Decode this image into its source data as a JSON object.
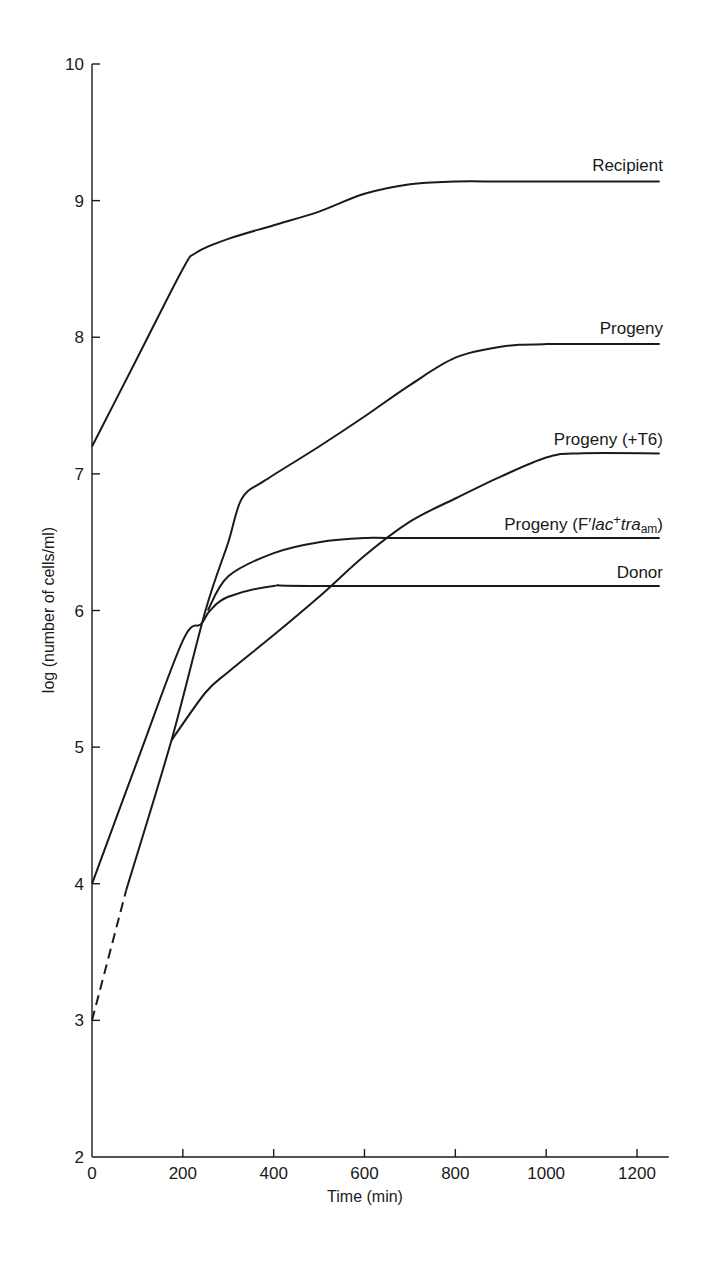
{
  "chart_data": {
    "type": "line",
    "title": "",
    "xlabel": "Time (min)",
    "ylabel": "log (number of cells/ml)",
    "xlim": [
      0,
      1270
    ],
    "ylim": [
      2,
      10
    ],
    "xticks": [
      0,
      200,
      400,
      600,
      800,
      1000,
      1200
    ],
    "yticks": [
      2,
      3,
      4,
      5,
      6,
      7,
      8,
      9,
      10
    ],
    "grid": false,
    "legend": "inline labels at right end of each curve",
    "series": [
      {
        "name": "Recipient",
        "label": "Recipient",
        "x": [
          0,
          100,
          200,
          230,
          300,
          400,
          500,
          600,
          700,
          800,
          900,
          1000,
          1250
        ],
        "y": [
          7.2,
          7.85,
          8.5,
          8.62,
          8.72,
          8.82,
          8.92,
          9.05,
          9.12,
          9.14,
          9.14,
          9.14,
          9.14
        ]
      },
      {
        "name": "Progeny",
        "label": "Progeny",
        "x": [
          0,
          75,
          175,
          250,
          300,
          330,
          380,
          500,
          600,
          700,
          800,
          900,
          1000,
          1250
        ],
        "y": [
          3.0,
          3.95,
          5.05,
          6.0,
          6.5,
          6.82,
          6.95,
          7.2,
          7.42,
          7.65,
          7.85,
          7.93,
          7.95,
          7.95
        ],
        "dashed_segment_x": [
          0,
          75
        ]
      },
      {
        "name": "Progeny (+T6)",
        "label": "Progeny (+T6)",
        "x": [
          175,
          250,
          300,
          400,
          500,
          600,
          700,
          800,
          900,
          1000,
          1070,
          1250
        ],
        "y": [
          5.05,
          5.4,
          5.55,
          5.82,
          6.1,
          6.4,
          6.65,
          6.82,
          6.98,
          7.12,
          7.15,
          7.15
        ]
      },
      {
        "name": "Progeny (F'lac+ tra_am)",
        "label": "Progeny (F'lac+tra am)",
        "x": [
          255,
          300,
          400,
          500,
          600,
          700,
          1250
        ],
        "y": [
          6.0,
          6.25,
          6.42,
          6.5,
          6.53,
          6.53,
          6.53
        ]
      },
      {
        "name": "Donor",
        "label": "Donor",
        "x": [
          0,
          100,
          200,
          240,
          260,
          300,
          400,
          500,
          1250
        ],
        "y": [
          4.0,
          4.9,
          5.78,
          5.9,
          6.0,
          6.1,
          6.18,
          6.18,
          6.18
        ]
      }
    ]
  },
  "labels": {
    "recipient": "Recipient",
    "progeny": "Progeny",
    "progeny_t6": "Progeny (+T6)",
    "progeny_flac_prefix": "Progeny (F′",
    "progeny_flac_lac": "lac",
    "progeny_flac_plus": "+",
    "progeny_flac_tra": "tra",
    "progeny_flac_sub": "am",
    "progeny_flac_suffix": ")",
    "donor": "Donor"
  },
  "colors": {
    "line": "#1a1a1a",
    "background": "#ffffff"
  }
}
